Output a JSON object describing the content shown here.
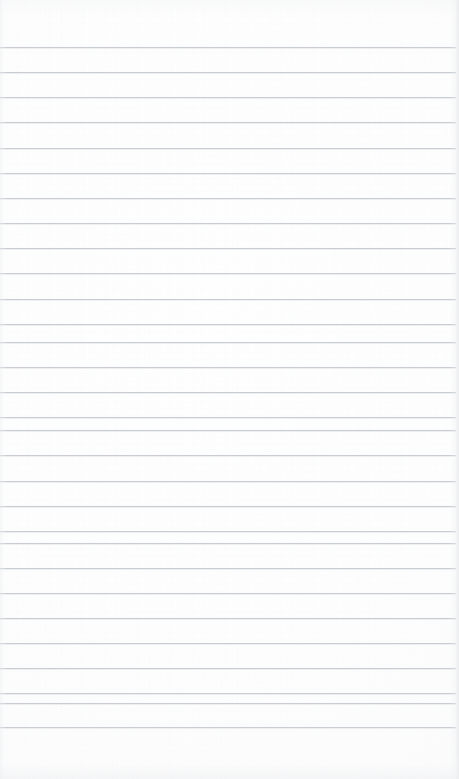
{
  "document": {
    "kind": "scanned-ruled-notebook-page",
    "page_label": "",
    "visible_text": "",
    "page_width_px": 459,
    "page_height_px": 779,
    "paper_color": "#fdfdfd",
    "is_blank": true
  },
  "ruling": {
    "style": "horizontal-ruled",
    "line_color": "#c7cbd0",
    "line_thickness_px": 1,
    "line_spacing_px": 25.2,
    "first_line_y_px": 47,
    "last_line_y_px": 727,
    "line_count": 28,
    "line_start_x_px": 0,
    "line_end_x_px": 456,
    "vertical_margin_rule": false,
    "punch_holes": false
  },
  "margins": {
    "top_margin_px": 47,
    "bottom_margin_px": 52,
    "left_margin_px": 0,
    "right_margin_px": 3
  },
  "scan_artifacts": {
    "edge_shadow_color": "#e4e6e8",
    "vignette": true,
    "banding": true
  },
  "lines": [
    {
      "index": 1,
      "y": 47
    },
    {
      "index": 2,
      "y": 72
    },
    {
      "index": 3,
      "y": 97
    },
    {
      "index": 4,
      "y": 122
    },
    {
      "index": 5,
      "y": 148
    },
    {
      "index": 6,
      "y": 173
    },
    {
      "index": 7,
      "y": 198
    },
    {
      "index": 8,
      "y": 223
    },
    {
      "index": 9,
      "y": 248
    },
    {
      "index": 10,
      "y": 273
    },
    {
      "index": 11,
      "y": 299
    },
    {
      "index": 12,
      "y": 324
    },
    {
      "index": 13,
      "y": 342
    },
    {
      "index": 14,
      "y": 367
    },
    {
      "index": 15,
      "y": 392
    },
    {
      "index": 16,
      "y": 417
    },
    {
      "index": 17,
      "y": 430
    },
    {
      "index": 18,
      "y": 455
    },
    {
      "index": 19,
      "y": 481
    },
    {
      "index": 20,
      "y": 506
    },
    {
      "index": 21,
      "y": 531
    },
    {
      "index": 22,
      "y": 543
    },
    {
      "index": 23,
      "y": 568
    },
    {
      "index": 24,
      "y": 593
    },
    {
      "index": 25,
      "y": 618
    },
    {
      "index": 26,
      "y": 643
    },
    {
      "index": 27,
      "y": 668
    },
    {
      "index": 28,
      "y": 693
    },
    {
      "index": 29,
      "y": 703
    },
    {
      "index": 30,
      "y": 727
    }
  ]
}
